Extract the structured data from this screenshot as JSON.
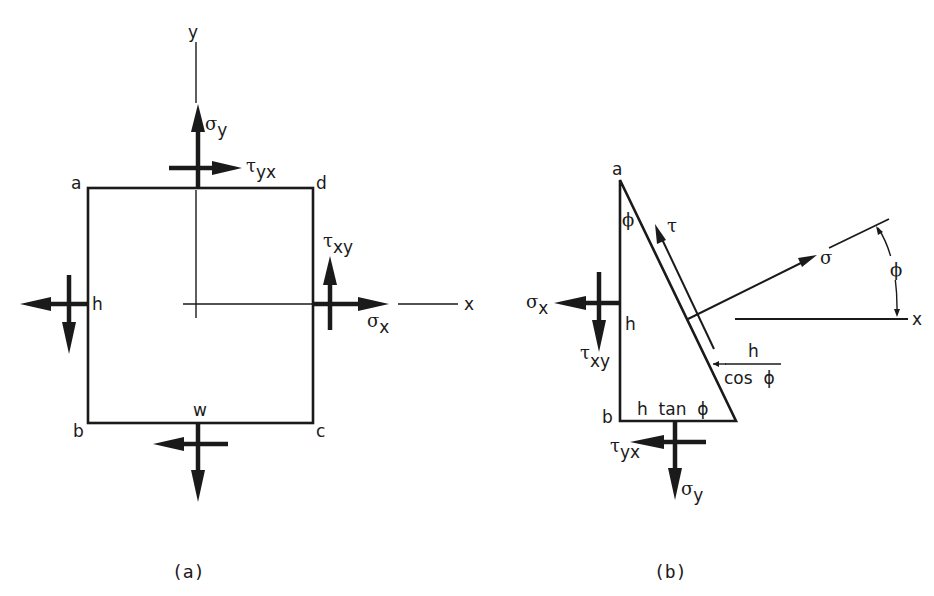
{
  "figure": {
    "panel_a": {
      "caption": "(a)",
      "axis_labels": {
        "y": "y",
        "x": "x"
      },
      "corner_labels": {
        "a": "a",
        "b": "b",
        "c": "c",
        "d": "d"
      },
      "dimension_labels": {
        "height": "h",
        "width": "w"
      },
      "stress_labels": {
        "sigma_y": {
          "symbol": "σ",
          "sub": "y"
        },
        "tau_yx": {
          "symbol": "τ",
          "sub": "yx"
        },
        "tau_xy": {
          "symbol": "τ",
          "sub": "xy"
        },
        "sigma_x": {
          "symbol": "σ",
          "sub": "x"
        }
      }
    },
    "panel_b": {
      "caption": "(b)",
      "corner_labels": {
        "a": "a",
        "b": "b"
      },
      "angle_label": "ϕ",
      "side_labels": {
        "vertical": "h",
        "bottom": "h  tan  ϕ",
        "hyp_num": "h",
        "hyp_den": "cos  ϕ"
      },
      "stress_labels": {
        "tau": "τ",
        "sigma": "σ",
        "sigma_x": {
          "symbol": "σ",
          "sub": "x"
        },
        "tau_xy": {
          "symbol": "τ",
          "sub": "xy"
        },
        "tau_yx": {
          "symbol": "τ",
          "sub": "yx"
        },
        "sigma_y": {
          "symbol": "σ",
          "sub": "y"
        }
      },
      "axis_labels": {
        "x": "x"
      },
      "normal_angle_label": "ϕ"
    }
  }
}
